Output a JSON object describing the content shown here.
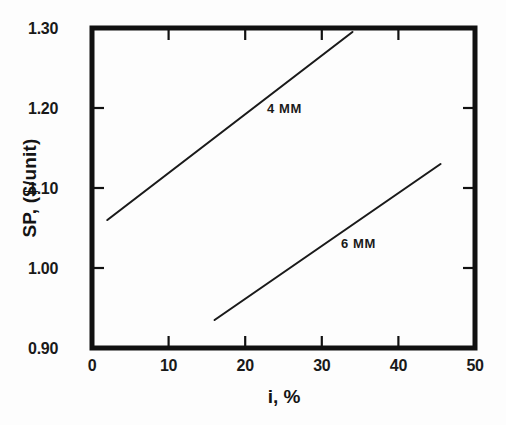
{
  "chart_data": {
    "type": "line",
    "title": "",
    "xlabel": "i, %",
    "ylabel": "SP, ($/unit)",
    "xlim": [
      0,
      50
    ],
    "ylim": [
      0.9,
      1.3
    ],
    "xticks": [
      "0",
      "10",
      "20",
      "30",
      "40",
      "50"
    ],
    "xtick_values": [
      0,
      10,
      20,
      30,
      40,
      50
    ],
    "yticks": [
      "0.90",
      "1.00",
      "1.10",
      "1.20",
      "1.30"
    ],
    "ytick_values": [
      0.9,
      1.0,
      1.1,
      1.2,
      1.3
    ],
    "grid": false,
    "legend": "inline-labels",
    "series": [
      {
        "name": "4 MM",
        "x": [
          2.0,
          34.0
        ],
        "y": [
          1.06,
          1.295
        ],
        "color": "#1a1a1a",
        "label_x": 21.0,
        "label_y": 1.203
      },
      {
        "name": "6 MM",
        "x": [
          16.0,
          45.5
        ],
        "y": [
          0.935,
          1.13
        ],
        "color": "#1a1a1a",
        "label_x": 33.0,
        "label_y": 1.024
      }
    ],
    "annotations": [
      {
        "text": "4 MM",
        "x": 21.0,
        "y": 1.203
      },
      {
        "text": "6 MM",
        "x": 33.0,
        "y": 1.024
      }
    ],
    "axis_color": "#111111",
    "background": "#fdfdfd"
  },
  "axes": {
    "x_title": "i, %",
    "y_title": "SP, ($/unit)",
    "x_tick_labels": [
      "0",
      "10",
      "20",
      "30",
      "40",
      "50"
    ],
    "y_tick_labels": [
      "0.90",
      "1.00",
      "1.10",
      "1.20",
      "1.30"
    ]
  },
  "series_labels": {
    "first": "4 MM",
    "second": "6 MM"
  }
}
